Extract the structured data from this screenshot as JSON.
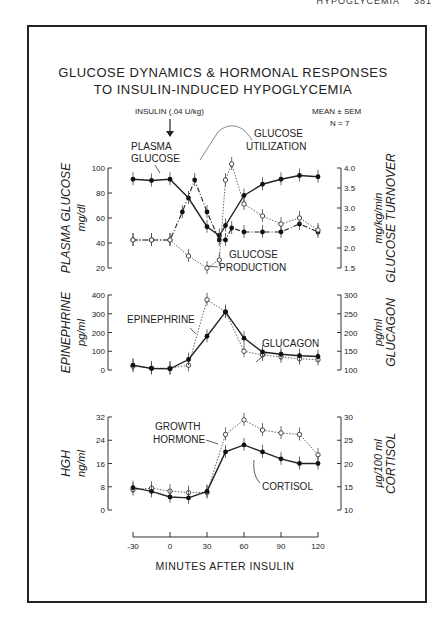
{
  "header": {
    "running_head": "HYPOGLYCEMIA",
    "page": "381"
  },
  "figure": {
    "title_line1": "GLUCOSE DYNAMICS & HORMONAL RESPONSES",
    "title_line2": "TO INSULIN-INDUCED HYPOGLYCEMIA",
    "insulin_label": "INSULIN (.04 U/kg)",
    "stats_label": "MEAN ± SEM",
    "n_label": "N = 7",
    "xlabel": "MINUTES AFTER INSULIN"
  },
  "chart_data": [
    {
      "type": "line",
      "title": "Plasma glucose and glucose turnover",
      "xlabel": "MINUTES AFTER INSULIN",
      "ylabel": "PLASMA GLUCOSE mg/dl",
      "ylabel_right": "GLUCOSE TURNOVER mg/kg/min",
      "ylim": [
        20,
        100
      ],
      "ylim_right": [
        1.5,
        4.0
      ],
      "yticks": [
        20,
        40,
        60,
        80,
        100
      ],
      "yticks_right": [
        1.5,
        2.0,
        2.5,
        3.0,
        3.5,
        4.0
      ],
      "annotations": [
        "PLASMA GLUCOSE",
        "GLUCOSE UTILIZATION",
        "GLUCOSE PRODUCTION"
      ],
      "series": [
        {
          "name": "Plasma Glucose",
          "axis": "left",
          "style": "solid-filled",
          "x": [
            -30,
            -15,
            0,
            15,
            30,
            40,
            45,
            60,
            75,
            90,
            105,
            120
          ],
          "values": [
            91,
            90,
            91,
            76,
            53,
            46,
            54,
            78,
            87,
            91,
            94,
            93
          ]
        },
        {
          "name": "Glucose Production",
          "axis": "right",
          "style": "dashdot-filled",
          "x": [
            -30,
            -15,
            0,
            10,
            20,
            30,
            40,
            45,
            50,
            60,
            75,
            90,
            105,
            120
          ],
          "values": [
            2.2,
            2.2,
            2.2,
            2.9,
            3.7,
            2.9,
            2.2,
            2.2,
            2.5,
            2.4,
            2.4,
            2.4,
            2.6,
            2.4
          ]
        },
        {
          "name": "Glucose Utilization",
          "axis": "right",
          "style": "dotted-open",
          "x": [
            -30,
            -15,
            0,
            15,
            30,
            40,
            45,
            50,
            60,
            75,
            90,
            105,
            120
          ],
          "values": [
            2.2,
            2.2,
            2.2,
            1.8,
            1.5,
            1.7,
            3.7,
            4.1,
            3.1,
            2.8,
            2.6,
            2.75,
            2.45
          ]
        }
      ]
    },
    {
      "type": "line",
      "title": "Epinephrine and glucagon",
      "ylabel": "EPINEPHRINE pg/ml",
      "ylabel_right": "GLUCAGON pg/ml",
      "ylim": [
        0,
        400
      ],
      "ylim_right": [
        100,
        300
      ],
      "yticks": [
        0,
        100,
        200,
        300,
        400
      ],
      "yticks_right": [
        100,
        150,
        200,
        250,
        300
      ],
      "annotations": [
        "EPINEPHRINE",
        "GLUCAGON"
      ],
      "series": [
        {
          "name": "Epinephrine",
          "axis": "left",
          "style": "dotted-open",
          "x": [
            -30,
            -15,
            0,
            15,
            30,
            45,
            60,
            75,
            90,
            105,
            120
          ],
          "values": [
            20,
            10,
            10,
            25,
            375,
            310,
            100,
            80,
            70,
            60,
            55
          ]
        },
        {
          "name": "Glucagon",
          "axis": "right",
          "style": "solid-filled",
          "x": [
            -30,
            -15,
            0,
            15,
            30,
            45,
            60,
            75,
            90,
            105,
            120
          ],
          "values": [
            113,
            104,
            103,
            128,
            190,
            255,
            185,
            148,
            142,
            138,
            136
          ]
        }
      ]
    },
    {
      "type": "line",
      "title": "Growth hormone and cortisol",
      "ylabel": "HGH ng/ml",
      "ylabel_right": "CORTISOL µg/100 ml",
      "ylim": [
        0,
        32
      ],
      "ylim_right": [
        10,
        30
      ],
      "yticks": [
        0,
        8,
        16,
        24,
        32
      ],
      "yticks_right": [
        10,
        15,
        20,
        25,
        30
      ],
      "xticks": [
        -30,
        0,
        30,
        60,
        90,
        120
      ],
      "annotations": [
        "GROWTH HORMONE",
        "CORTISOL"
      ],
      "series": [
        {
          "name": "Growth Hormone",
          "axis": "left",
          "style": "dotted-open",
          "x": [
            -30,
            -15,
            0,
            15,
            30,
            45,
            60,
            75,
            90,
            105,
            120
          ],
          "values": [
            7,
            7.5,
            6.5,
            6,
            6,
            26,
            31,
            27.5,
            26.5,
            26,
            19
          ]
        },
        {
          "name": "Cortisol",
          "axis": "right",
          "style": "solid-filled",
          "x": [
            -30,
            -15,
            0,
            15,
            30,
            45,
            60,
            75,
            90,
            105,
            120
          ],
          "values": [
            14.8,
            14,
            12.8,
            12.6,
            14,
            22.5,
            24,
            22.5,
            21,
            20,
            20
          ]
        }
      ]
    }
  ]
}
